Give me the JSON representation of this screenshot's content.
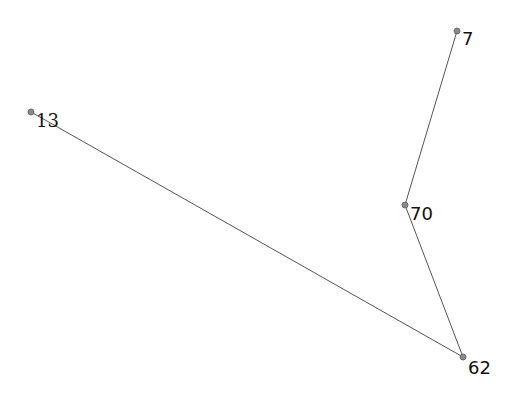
{
  "graph": {
    "nodes": [
      {
        "id": "13",
        "label": "13",
        "x": 31,
        "y": 112,
        "lx": 36,
        "ly": 127,
        "serif": true
      },
      {
        "id": "7",
        "label": "7",
        "x": 457,
        "y": 31,
        "lx": 462,
        "ly": 45,
        "serif": false
      },
      {
        "id": "70",
        "label": "70",
        "x": 405,
        "y": 205,
        "lx": 410,
        "ly": 220,
        "serif": false
      },
      {
        "id": "62",
        "label": "62",
        "x": 463,
        "y": 357,
        "lx": 468,
        "ly": 374,
        "serif": false
      }
    ],
    "edges": [
      {
        "source": "13",
        "target": "62"
      },
      {
        "source": "62",
        "target": "70"
      },
      {
        "source": "70",
        "target": "7"
      }
    ],
    "colors": {
      "edge": "#555555",
      "node": "#8a8a8a",
      "label": "#111111",
      "background": "#ffffff"
    }
  }
}
